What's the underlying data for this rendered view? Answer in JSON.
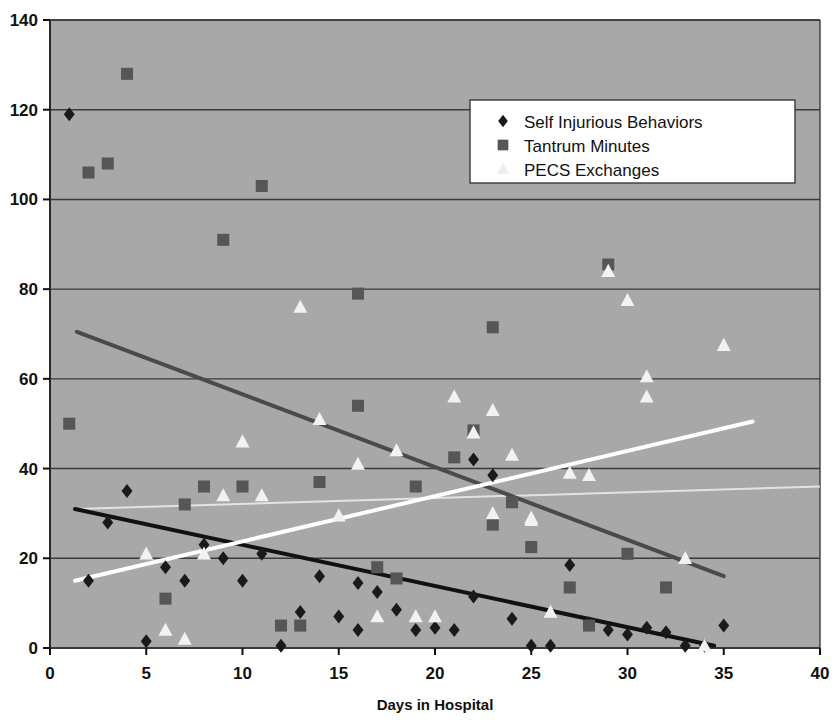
{
  "chart_data": {
    "type": "scatter",
    "title": "",
    "xlabel": "Days in Hospital",
    "ylabel": "",
    "xlim": [
      0,
      40
    ],
    "ylim": [
      0,
      140
    ],
    "xticks": [
      0,
      5,
      10,
      15,
      20,
      25,
      30,
      35,
      40
    ],
    "yticks": [
      0,
      20,
      40,
      60,
      80,
      100,
      120,
      140
    ],
    "grid": "horizontal",
    "plot_background": "#a8a8a8",
    "legend_position": "top-right",
    "series": [
      {
        "name": "Self Injurious Behaviors",
        "marker": "diamond",
        "color": "#1a1a1a",
        "points": [
          [
            1,
            119
          ],
          [
            2,
            15
          ],
          [
            3,
            28
          ],
          [
            4,
            35
          ],
          [
            5,
            1.5
          ],
          [
            6,
            18
          ],
          [
            7,
            15
          ],
          [
            8,
            23
          ],
          [
            9,
            20
          ],
          [
            10,
            15
          ],
          [
            11,
            21
          ],
          [
            12,
            0.5
          ],
          [
            13,
            8
          ],
          [
            14,
            16
          ],
          [
            15,
            7
          ],
          [
            16,
            4
          ],
          [
            16,
            14.5
          ],
          [
            17,
            12.5
          ],
          [
            18,
            8.5
          ],
          [
            19,
            4
          ],
          [
            20,
            4.5
          ],
          [
            21,
            4
          ],
          [
            22,
            11.5
          ],
          [
            22,
            42
          ],
          [
            23,
            38.5
          ],
          [
            24,
            6.5
          ],
          [
            25,
            0.5
          ],
          [
            26,
            0.5
          ],
          [
            27,
            18.5
          ],
          [
            28,
            5.5
          ],
          [
            29,
            4
          ],
          [
            30,
            3
          ],
          [
            31,
            4.5
          ],
          [
            32,
            3.5
          ],
          [
            33,
            0.5
          ],
          [
            34,
            0.5
          ],
          [
            35,
            5
          ]
        ],
        "trendline": {
          "color": "#111111",
          "width": 4,
          "x0": 1.3,
          "y0": 31,
          "x1": 34.5,
          "y1": 0.5
        }
      },
      {
        "name": "Tantrum Minutes",
        "marker": "square",
        "color": "#565656",
        "points": [
          [
            1,
            50
          ],
          [
            2,
            106
          ],
          [
            3,
            108
          ],
          [
            4,
            128
          ],
          [
            6,
            11
          ],
          [
            7,
            32
          ],
          [
            8,
            36
          ],
          [
            9,
            91
          ],
          [
            10,
            36
          ],
          [
            11,
            103
          ],
          [
            12,
            5
          ],
          [
            13,
            5
          ],
          [
            14,
            37
          ],
          [
            16,
            79
          ],
          [
            16,
            54
          ],
          [
            17,
            18
          ],
          [
            18,
            15.5
          ],
          [
            19,
            36
          ],
          [
            21,
            42.5
          ],
          [
            22,
            48.5
          ],
          [
            23,
            71.5
          ],
          [
            23,
            27.5
          ],
          [
            24,
            32.5
          ],
          [
            25,
            22.5
          ],
          [
            27,
            13.5
          ],
          [
            28,
            5
          ],
          [
            29,
            85.5
          ],
          [
            30,
            21
          ],
          [
            32,
            13.5
          ]
        ],
        "trendline": {
          "color": "#4a4a4a",
          "width": 4,
          "x0": 1.4,
          "y0": 70.5,
          "x1": 35,
          "y1": 16
        }
      },
      {
        "name": "PECS Exchanges",
        "marker": "triangle",
        "color": "#f2f2f2",
        "points": [
          [
            5,
            21
          ],
          [
            6,
            4
          ],
          [
            7,
            2
          ],
          [
            8,
            21
          ],
          [
            9,
            34
          ],
          [
            10,
            46
          ],
          [
            11,
            34
          ],
          [
            13,
            76
          ],
          [
            14,
            51
          ],
          [
            15,
            29.5
          ],
          [
            16,
            41
          ],
          [
            17,
            7
          ],
          [
            18,
            44
          ],
          [
            19,
            7
          ],
          [
            20,
            7
          ],
          [
            21,
            56
          ],
          [
            22,
            48
          ],
          [
            23,
            53
          ],
          [
            23,
            30
          ],
          [
            24,
            43
          ],
          [
            25,
            28.5
          ],
          [
            25,
            29
          ],
          [
            26,
            8
          ],
          [
            27,
            39
          ],
          [
            28,
            38.5
          ],
          [
            29,
            84
          ],
          [
            30,
            77.5
          ],
          [
            31,
            56
          ],
          [
            31,
            60.5
          ],
          [
            33,
            20
          ],
          [
            34,
            0.5
          ],
          [
            35,
            67.5
          ]
        ],
        "trendline": {
          "color": "#ffffff",
          "width": 4,
          "x0": 1.3,
          "y0": 15,
          "x1": 36.5,
          "y1": 50.5
        },
        "secondary_trendline": {
          "color": "#e3e3e3",
          "width": 2,
          "x0": 1.3,
          "y0": 31,
          "x1": 40,
          "y1": 36
        }
      }
    ],
    "legend": [
      {
        "label": "Self Injurious Behaviors",
        "marker": "diamond",
        "color": "#1a1a1a"
      },
      {
        "label": "Tantrum Minutes",
        "marker": "square",
        "color": "#565656"
      },
      {
        "label": "PECS Exchanges",
        "marker": "triangle",
        "color": "#ededed"
      }
    ]
  }
}
